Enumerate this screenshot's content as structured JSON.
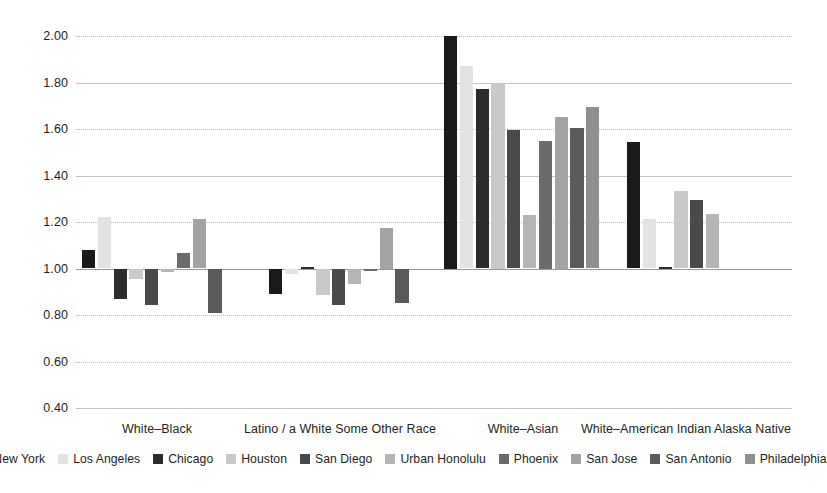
{
  "chart_data": {
    "type": "bar",
    "title": "",
    "subtitle": "",
    "xlabel": "",
    "ylabel": "",
    "ylim": [
      0.4,
      2.0
    ],
    "ytick_step": 0.2,
    "ytick_labels": [
      "2.00",
      "1.80",
      "1.60",
      "1.40",
      "1.20",
      "1.00",
      "0.80",
      "0.60",
      "0.40"
    ],
    "ytick_values": [
      2.0,
      1.8,
      1.6,
      1.4,
      1.2,
      1.0,
      0.8,
      0.6,
      0.4
    ],
    "grid": true,
    "reference_line": 1.0,
    "legend_position": "bottom",
    "categories": [
      "White–Black",
      "Latino / a White Some Other Race",
      "White–Asian",
      "White–American Indian Alaska Native"
    ],
    "series": [
      {
        "name": "New York",
        "color": "#1a1a1a",
        "values": [
          1.08,
          0.89,
          2.0,
          1.545
        ]
      },
      {
        "name": "Los Angeles",
        "color": "#e3e3e3",
        "values": [
          1.22,
          0.975,
          1.87,
          1.215
        ]
      },
      {
        "name": "Chicago",
        "color": "#2d2d2d",
        "values": [
          0.87,
          1.005,
          1.77,
          1.005
        ]
      },
      {
        "name": "Houston",
        "color": "#c9c9c9",
        "values": [
          0.955,
          0.885,
          1.8,
          1.335
        ]
      },
      {
        "name": "San Diego",
        "color": "#4a4a4a",
        "values": [
          0.845,
          0.845,
          1.595,
          1.295
        ]
      },
      {
        "name": "Urban Honolulu",
        "color": "#b5b5b5",
        "values": [
          0.985,
          0.935,
          1.23,
          1.235
        ]
      },
      {
        "name": "Phoenix",
        "color": "#6b6b6b",
        "values": [
          1.065,
          0.99,
          1.55,
          null
        ]
      },
      {
        "name": "San Jose",
        "color": "#a3a3a3",
        "values": [
          1.215,
          1.175,
          1.65,
          null
        ]
      },
      {
        "name": "San Antonio",
        "color": "#5a5a5a",
        "values": [
          0.81,
          0.85,
          1.605,
          null
        ]
      },
      {
        "name": "Philadelphia",
        "color": "#8f8f8f",
        "values": [
          null,
          null,
          1.695,
          null
        ]
      }
    ]
  }
}
